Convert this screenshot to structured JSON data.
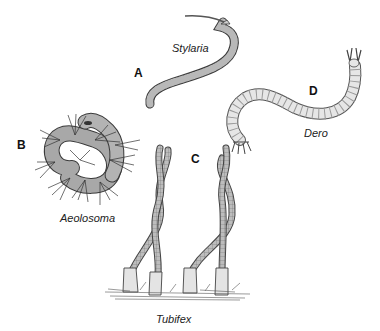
{
  "figure": {
    "panels": [
      {
        "letter": "A",
        "species": "Stylaria"
      },
      {
        "letter": "B",
        "species": "Aeolosoma"
      },
      {
        "letter": "C",
        "species": "Tubifex"
      },
      {
        "letter": "D",
        "species": "Dero"
      }
    ],
    "colors": {
      "body_fill": "#b8b8b8",
      "body_stroke": "#3a3a3a",
      "dero_fill": "#e2e2e2",
      "background": "#ffffff"
    }
  }
}
